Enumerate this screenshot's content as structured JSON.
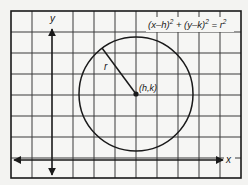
{
  "diagram": {
    "equation": {
      "text": "(x–h)² + (y–k)² = r²",
      "parts": [
        "(x–h)",
        "2",
        " + (y–k)",
        "2",
        " = r",
        "2"
      ]
    },
    "axes": {
      "x_label": "x",
      "y_label": "y"
    },
    "center_label": "(h,k)",
    "radius_label": "r",
    "colors": {
      "background": "#f3f3f1",
      "grid": "#2a2a2a",
      "ink": "#1a1a1a"
    },
    "grid": {
      "columns": 11,
      "rows": 8
    }
  }
}
